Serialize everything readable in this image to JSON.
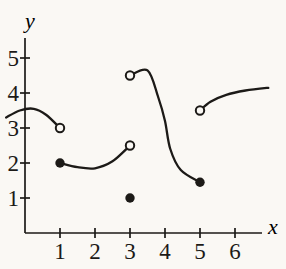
{
  "figure": {
    "background": "#faf8f4",
    "ink": "#1c1a17"
  },
  "chart_data": {
    "type": "line",
    "title": "",
    "xlabel": "x",
    "ylabel": "y",
    "x_ticks": [
      1,
      2,
      3,
      4,
      5,
      6
    ],
    "y_ticks": [
      1,
      2,
      3,
      4,
      5
    ],
    "xlim": [
      -0.7,
      7.4
    ],
    "ylim": [
      0,
      5.8
    ],
    "grid": false,
    "legend": false,
    "series": [
      {
        "name": "branch-1",
        "points": [
          [
            -0.54,
            3.3
          ],
          [
            -0.15,
            3.5
          ],
          [
            0.25,
            3.55
          ],
          [
            0.6,
            3.38
          ],
          [
            1,
            3
          ]
        ],
        "start_marker": "none",
        "end_marker": "open"
      },
      {
        "name": "branch-2",
        "points": [
          [
            1,
            2
          ],
          [
            1.5,
            1.88
          ],
          [
            2,
            1.85
          ],
          [
            2.5,
            2.05
          ],
          [
            3,
            2.5
          ]
        ],
        "start_marker": "closed",
        "end_marker": "open"
      },
      {
        "name": "branch-3",
        "points": [
          [
            3,
            4.5
          ],
          [
            3.5,
            4.65
          ],
          [
            3.8,
            3.9
          ],
          [
            4,
            3.2
          ],
          [
            4.15,
            2.4
          ],
          [
            4.45,
            1.8
          ],
          [
            5,
            1.45
          ]
        ],
        "start_marker": "open",
        "end_marker": "closed"
      },
      {
        "name": "isolated-point",
        "points": [
          [
            3,
            1
          ]
        ],
        "start_marker": "closed",
        "end_marker": "closed"
      },
      {
        "name": "branch-4",
        "points": [
          [
            5,
            3.5
          ],
          [
            5.3,
            3.75
          ],
          [
            5.75,
            3.95
          ],
          [
            6.3,
            4.07
          ],
          [
            6.95,
            4.15
          ]
        ],
        "start_marker": "open",
        "end_marker": "none"
      }
    ]
  }
}
